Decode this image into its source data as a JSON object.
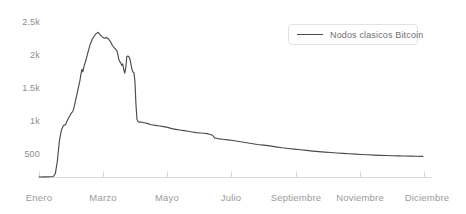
{
  "chart_data": {
    "type": "line",
    "title": "",
    "xlabel": "",
    "ylabel": "",
    "grid": false,
    "legend_position": "top-right",
    "legend": [
      "Nodos clasicos Bitcoin"
    ],
    "line_color": "#4a4a4a",
    "axis_color": "#d8d8d8",
    "label_color": "#9a9a9a",
    "ylim": [
      0,
      2500
    ],
    "yticks": [
      500,
      1000,
      1500,
      2000,
      2500
    ],
    "ytick_labels": [
      "500",
      "1k",
      "1.5k",
      "2k",
      "2.5k"
    ],
    "xtick_labels": [
      "Enero",
      "Marzo",
      "Mayo",
      "Septiembre",
      "Noviembre",
      "Diciembre"
    ],
    "xticks_all": [
      "Enero",
      "Marzo",
      "Mayo",
      "Julio",
      "Septiembre",
      "Noviembre",
      "Diciembre"
    ],
    "series": [
      {
        "name": "Nodos clasicos Bitcoin",
        "x": [
          "Enero",
          "Febrero",
          "Marzo",
          "Abril",
          "Mayo",
          "Junio",
          "Julio",
          "Agosto",
          "Septiembre",
          "Octubre",
          "Noviembre",
          "Diciembre"
        ],
        "values": [
          10,
          120,
          1900,
          2150,
          1600,
          830,
          780,
          700,
          620,
          520,
          430,
          320
        ]
      }
    ],
    "points": [
      [
        0,
        8
      ],
      [
        6,
        10
      ],
      [
        11,
        12
      ],
      [
        14,
        15
      ],
      [
        16,
        60
      ],
      [
        18,
        250
      ],
      [
        20,
        560
      ],
      [
        22,
        720
      ],
      [
        24,
        790
      ],
      [
        26,
        800
      ],
      [
        27,
        840
      ],
      [
        29,
        900
      ],
      [
        31,
        960
      ],
      [
        33,
        1000
      ],
      [
        34,
        1040
      ],
      [
        36,
        1180
      ],
      [
        38,
        1320
      ],
      [
        40,
        1460
      ],
      [
        41,
        1560
      ],
      [
        42,
        1640
      ],
      [
        43,
        1600
      ],
      [
        44,
        1680
      ],
      [
        46,
        1780
      ],
      [
        48,
        1900
      ],
      [
        50,
        2010
      ],
      [
        52,
        2090
      ],
      [
        54,
        2140
      ],
      [
        56,
        2180
      ],
      [
        58,
        2200
      ],
      [
        60,
        2160
      ],
      [
        62,
        2130
      ],
      [
        64,
        2110
      ],
      [
        66,
        2120
      ],
      [
        68,
        2100
      ],
      [
        70,
        2060
      ],
      [
        72,
        2000
      ],
      [
        74,
        1960
      ],
      [
        76,
        1930
      ],
      [
        77,
        1880
      ],
      [
        78,
        1800
      ],
      [
        79,
        1760
      ],
      [
        80,
        1740
      ],
      [
        81,
        1700
      ],
      [
        82,
        1720
      ],
      [
        83,
        1640
      ],
      [
        84,
        1580
      ],
      [
        85,
        1660
      ],
      [
        86,
        1830
      ],
      [
        87,
        1840
      ],
      [
        88,
        1830
      ],
      [
        89,
        1800
      ],
      [
        90,
        1720
      ],
      [
        91,
        1640
      ],
      [
        92,
        1600
      ],
      [
        93,
        1590
      ],
      [
        94,
        1450
      ],
      [
        95,
        1100
      ],
      [
        96,
        880
      ],
      [
        97,
        850
      ],
      [
        98,
        840
      ],
      [
        100,
        840
      ],
      [
        103,
        830
      ],
      [
        106,
        820
      ],
      [
        110,
        800
      ],
      [
        114,
        790
      ],
      [
        118,
        780
      ],
      [
        122,
        770
      ],
      [
        126,
        760
      ],
      [
        130,
        740
      ],
      [
        134,
        730
      ],
      [
        138,
        720
      ],
      [
        142,
        710
      ],
      [
        146,
        700
      ],
      [
        150,
        690
      ],
      [
        154,
        680
      ],
      [
        158,
        675
      ],
      [
        162,
        670
      ],
      [
        166,
        660
      ],
      [
        170,
        640
      ],
      [
        172,
        600
      ],
      [
        175,
        590
      ],
      [
        180,
        580
      ],
      [
        185,
        570
      ],
      [
        190,
        560
      ],
      [
        196,
        545
      ],
      [
        202,
        530
      ],
      [
        208,
        515
      ],
      [
        214,
        500
      ],
      [
        220,
        490
      ],
      [
        226,
        480
      ],
      [
        232,
        465
      ],
      [
        238,
        450
      ],
      [
        244,
        440
      ],
      [
        250,
        430
      ],
      [
        256,
        420
      ],
      [
        262,
        410
      ],
      [
        268,
        400
      ],
      [
        274,
        392
      ],
      [
        280,
        385
      ],
      [
        286,
        378
      ],
      [
        292,
        372
      ],
      [
        298,
        366
      ],
      [
        304,
        360
      ],
      [
        310,
        354
      ],
      [
        316,
        348
      ],
      [
        322,
        344
      ],
      [
        328,
        340
      ],
      [
        334,
        336
      ],
      [
        340,
        333
      ],
      [
        346,
        330
      ],
      [
        352,
        328
      ],
      [
        358,
        326
      ],
      [
        364,
        324
      ],
      [
        370,
        322
      ],
      [
        376,
        320
      ]
    ]
  },
  "axis": {
    "y": {
      "ticks": [
        {
          "label": "2.5k",
          "top": 17
        },
        {
          "label": "2k",
          "top": 50
        },
        {
          "label": "1.5k",
          "top": 83
        },
        {
          "label": "1k",
          "top": 116
        },
        {
          "label": "500",
          "top": 149
        }
      ]
    },
    "x": {
      "ticks": [
        {
          "label": "Enero",
          "left": 39
        },
        {
          "label": "Marzo",
          "left": 103
        },
        {
          "label": "Mayo",
          "left": 167
        },
        {
          "label": "Julio",
          "left": 231
        },
        {
          "label": "Septiembre",
          "left": 296
        },
        {
          "label": "Noviembre",
          "left": 360
        },
        {
          "label": "Diciembre",
          "left": 427
        }
      ],
      "tick_marks": [
        39,
        103,
        167,
        231,
        296,
        360,
        424
      ]
    }
  },
  "legend": {
    "label": "Nodos clasicos Bitcoin"
  }
}
